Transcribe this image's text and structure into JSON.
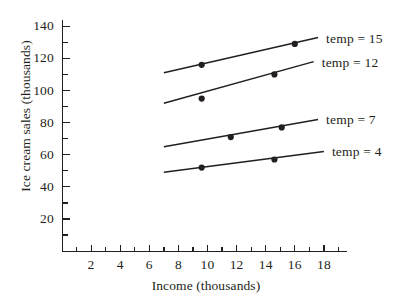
{
  "chart_data": {
    "type": "line",
    "title": "",
    "xlabel": "Income (thousands)",
    "ylabel": "Ice cream sales (thousands)",
    "xlim": [
      0,
      20
    ],
    "ylim": [
      0,
      150
    ],
    "xticks": [
      2,
      4,
      6,
      8,
      10,
      12,
      14,
      16,
      18
    ],
    "xtick_labels": [
      "2",
      "4",
      "6",
      "8",
      "10",
      "12",
      "14",
      "16",
      "18"
    ],
    "xminor_step": 1,
    "yticks": [
      20,
      40,
      60,
      80,
      100,
      120,
      140
    ],
    "ytick_labels": [
      "20",
      "40",
      "60",
      "80",
      "100",
      "120",
      "140"
    ],
    "yminor_step": 10,
    "grid": false,
    "legend_position": "right-inline",
    "series": [
      {
        "name": "temp = 15",
        "label": "temp = 15",
        "color": "#231f20",
        "line": {
          "x_start": 7.0,
          "y_start": 111,
          "x_end": 17.6,
          "y_end": 133
        },
        "points": [
          {
            "x": 9.6,
            "y": 116
          },
          {
            "x": 16.0,
            "y": 129
          }
        ]
      },
      {
        "name": "temp = 12",
        "label": "temp = 12",
        "color": "#231f20",
        "line": {
          "x_start": 7.0,
          "y_start": 92,
          "x_end": 17.3,
          "y_end": 118
        },
        "points": [
          {
            "x": 9.6,
            "y": 95
          },
          {
            "x": 14.6,
            "y": 110
          }
        ]
      },
      {
        "name": "temp = 7",
        "label": "temp = 7",
        "color": "#231f20",
        "line": {
          "x_start": 7.0,
          "y_start": 65,
          "x_end": 17.6,
          "y_end": 82
        },
        "points": [
          {
            "x": 11.6,
            "y": 71
          },
          {
            "x": 15.1,
            "y": 77
          }
        ]
      },
      {
        "name": "temp = 4",
        "label": "temp = 4",
        "color": "#231f20",
        "line": {
          "x_start": 7.0,
          "y_start": 49,
          "x_end": 18.0,
          "y_end": 62
        },
        "points": [
          {
            "x": 9.6,
            "y": 52
          },
          {
            "x": 14.6,
            "y": 57
          }
        ]
      }
    ]
  },
  "legend": {
    "items": [
      {
        "label": "temp = 15"
      },
      {
        "label": "temp = 12"
      },
      {
        "label": "temp = 7"
      },
      {
        "label": "temp = 4"
      }
    ]
  },
  "axes": {
    "x_title": "Income (thousands)",
    "y_title": "Ice cream sales (thousands)"
  }
}
